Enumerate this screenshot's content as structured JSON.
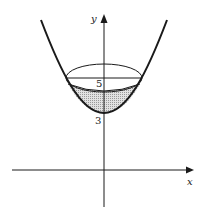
{
  "figure": {
    "type": "paraboloid cross-section with liquid",
    "axes": {
      "x_label": "x",
      "y_label": "y"
    },
    "labels": {
      "vertex_value": "3",
      "rim_value": "5"
    },
    "colors": {
      "stroke": "#1a1a1a",
      "shade": "#c8c8c8",
      "background": "#ffffff"
    }
  }
}
